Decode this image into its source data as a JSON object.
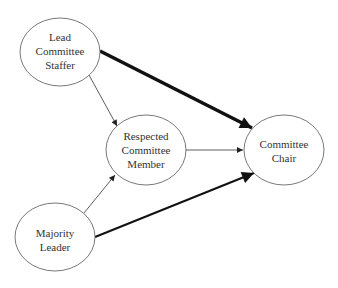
{
  "diagram": {
    "nodes": [
      {
        "id": "staffer",
        "lines": [
          "Lead",
          "Committee",
          "Staffer"
        ],
        "cx": 60,
        "cy": 52,
        "rx": 40,
        "ry": 34
      },
      {
        "id": "member",
        "lines": [
          "Respected",
          "Committee",
          "Member"
        ],
        "cx": 146,
        "cy": 150,
        "rx": 40,
        "ry": 35
      },
      {
        "id": "chair",
        "lines": [
          "Committee",
          "Chair"
        ],
        "cx": 284,
        "cy": 150,
        "rx": 40,
        "ry": 35
      },
      {
        "id": "leader",
        "lines": [
          "Majority",
          "Leader"
        ],
        "cx": 55,
        "cy": 237,
        "rx": 40,
        "ry": 34
      }
    ],
    "edges": [
      {
        "from": "staffer",
        "to": "chair",
        "weight": "thick"
      },
      {
        "from": "staffer",
        "to": "member",
        "weight": "thin"
      },
      {
        "from": "member",
        "to": "chair",
        "weight": "thin"
      },
      {
        "from": "leader",
        "to": "member",
        "weight": "thin"
      },
      {
        "from": "leader",
        "to": "chair",
        "weight": "medium"
      }
    ]
  }
}
